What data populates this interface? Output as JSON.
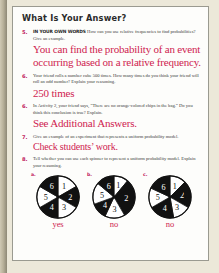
{
  "page": {
    "heading": "What Is Your Answer?",
    "accent_red": "#cf2350",
    "number_color": "#c0185b",
    "paper_color": "#fdfdfb",
    "scan_border_color": "#ece8d9"
  },
  "exercises": [
    {
      "number": "5.",
      "lead": "IN YOUR OWN WORDS",
      "prompt": "How can you use relative frequencies to find probabilities? Give an example.",
      "answer": "You can find the probability of an event occurring based on a relative frequency."
    },
    {
      "number": "6.",
      "lead": "",
      "prompt": "Your friend rolls a number cube 500 times. How many times do you think your friend will roll an odd number? Explain your reasoning.",
      "answer": "250 times"
    },
    {
      "number": "6.",
      "lead": "",
      "prompt": "In Activity 2, your friend says, “There are no orange-colored chips in the bag.” Do you think this conclusion is true? Explain.",
      "answer": "See Additional Answers."
    },
    {
      "number": "7.",
      "lead": "",
      "prompt": "Give an example of an experiment that represents a uniform probability model.",
      "answer": "Check students’ work."
    },
    {
      "number": "8.",
      "lead": "",
      "prompt": "Tell whether you can use each spinner to represent a uniform probability model. Explain your reasoning.",
      "answer": ""
    }
  ],
  "spinners": [
    {
      "letter": "a.",
      "answer": "yes",
      "uniform": true,
      "sector_labels": [
        "1",
        "2",
        "3",
        "4",
        "5",
        "6"
      ],
      "sector_angles": [
        60,
        60,
        60,
        60,
        60,
        60
      ],
      "sector_fills": [
        "#ffffff",
        "#111111",
        "#ffffff",
        "#111111",
        "#ffffff",
        "#111111"
      ]
    },
    {
      "letter": "b.",
      "answer": "no",
      "uniform": false,
      "sector_labels": [
        "1",
        "2",
        "3",
        "4",
        "5",
        "6"
      ],
      "sector_angles": [
        40,
        110,
        55,
        45,
        60,
        50
      ],
      "sector_fills": [
        "#ffffff",
        "#111111",
        "#ffffff",
        "#111111",
        "#ffffff",
        "#111111"
      ]
    },
    {
      "letter": "c.",
      "answer": "no",
      "uniform": false,
      "sector_labels": [
        "1",
        "2",
        "3",
        "4",
        "5",
        "6"
      ],
      "sector_angles": [
        45,
        75,
        50,
        70,
        55,
        65
      ],
      "sector_fills": [
        "#ffffff",
        "#111111",
        "#ffffff",
        "#111111",
        "#ffffff",
        "#111111"
      ]
    }
  ]
}
